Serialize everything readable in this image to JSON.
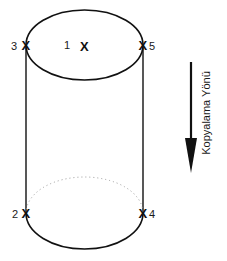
{
  "diagram": {
    "type": "cylinder-measurement-points",
    "points": [
      {
        "id": "1",
        "label": "1",
        "marker": "X",
        "location": "top-center"
      },
      {
        "id": "2",
        "label": "2",
        "marker": "X",
        "location": "bottom-left"
      },
      {
        "id": "3",
        "label": "3",
        "marker": "X",
        "location": "top-left"
      },
      {
        "id": "4",
        "label": "4",
        "marker": "X",
        "location": "bottom-right"
      },
      {
        "id": "5",
        "label": "5",
        "marker": "X",
        "location": "top-right"
      }
    ],
    "direction_arrow": {
      "label": "Kopyalama Yönü",
      "orientation": "down"
    },
    "colors": {
      "stroke": "#111111",
      "hidden_edge": "#9a9a9a",
      "background": "#ffffff"
    }
  }
}
